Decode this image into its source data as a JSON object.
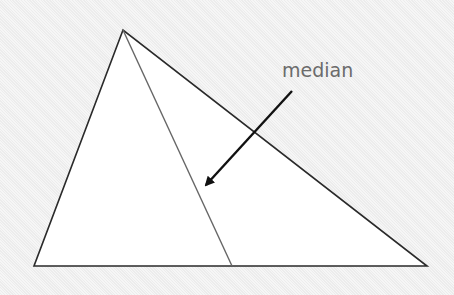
{
  "diagram": {
    "label": "median",
    "colors": {
      "background": "#f1f1f1",
      "triangle_fill": "#ffffff",
      "triangle_stroke": "#2a2a2a",
      "median_stroke": "#666666",
      "arrow": "#111111",
      "label": "#6b6b6b"
    },
    "triangle": {
      "apex": [
        123,
        30
      ],
      "bottom_left": [
        34,
        266
      ],
      "bottom_right": [
        427,
        266
      ]
    },
    "median": {
      "from": [
        123,
        30
      ],
      "to": [
        232,
        266
      ]
    },
    "arrow": {
      "from": [
        292,
        91
      ],
      "to": [
        203,
        188
      ]
    }
  }
}
